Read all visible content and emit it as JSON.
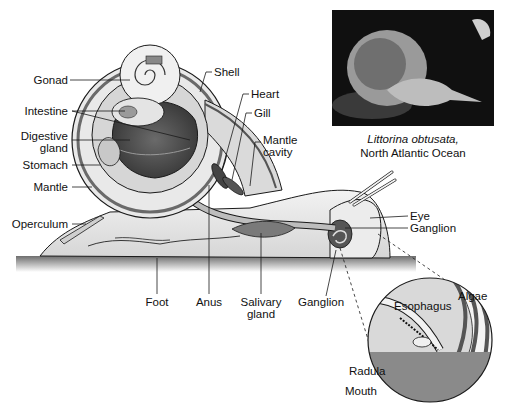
{
  "figure": {
    "photo": {
      "species": "Littorina obtusata,",
      "location": "North Atlantic Ocean"
    },
    "labels": {
      "gonad": "Gonad",
      "intestine": "Intestine",
      "digestive_gland_1": "Digestive",
      "digestive_gland_2": "gland",
      "stomach": "Stomach",
      "mantle": "Mantle",
      "operculum": "Operculum",
      "shell": "Shell",
      "heart": "Heart",
      "gill": "Gill",
      "mantle_cavity_1": "Mantle",
      "mantle_cavity_2": "cavity",
      "eye": "Eye",
      "ganglion_head": "Ganglion",
      "foot": "Foot",
      "anus": "Anus",
      "salivary_gland_1": "Salivary",
      "salivary_gland_2": "gland",
      "ganglion_lower": "Ganglion",
      "algae": "Algae",
      "esophagus": "Esophagus",
      "radula": "Radula",
      "mouth": "Mouth"
    },
    "colors": {
      "background": "#ffffff",
      "line": "#1a1a1a",
      "body_light": "#e6e6e6",
      "organ_dark": "#4a4a4a",
      "ground": "#8a8a8a"
    }
  }
}
